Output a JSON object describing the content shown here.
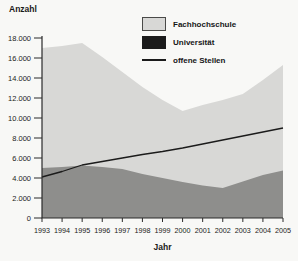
{
  "page": {
    "background": "#f8f8f6"
  },
  "chart_data": {
    "type": "area",
    "title": "",
    "xlabel": "Jahr",
    "ylabel": "Anzahl",
    "x": [
      1993,
      1994,
      1995,
      1996,
      1997,
      1998,
      1999,
      2000,
      2001,
      2002,
      2003,
      2004,
      2005
    ],
    "xtick_labels": [
      "1993",
      "1994",
      "1995",
      "1996",
      "1997",
      "1998",
      "1999",
      "2000",
      "2001",
      "2002",
      "2003",
      "2004",
      "2005"
    ],
    "ylim": [
      0,
      18000
    ],
    "ytick_step": 2000,
    "ytick_labels": [
      "0",
      "2.000",
      "4.000",
      "6.000",
      "8.000",
      "10.000",
      "12.000",
      "14.000",
      "16.000",
      "18.000"
    ],
    "grid": false,
    "legend_position": "top-right",
    "axis_color": "#2b2b2b",
    "text_color": "#1e1e1e",
    "series": [
      {
        "name": "Fachhochschule",
        "type": "area",
        "color": "#d8d8d6",
        "values": [
          17000,
          17200,
          17500,
          16100,
          14600,
          13100,
          11800,
          10700,
          11300,
          11800,
          12400,
          13800,
          15300
        ]
      },
      {
        "name": "Universität",
        "type": "area",
        "color": "#8e8e8c",
        "legend_swatch": "#1b1b1b",
        "values": [
          5000,
          5100,
          5250,
          5100,
          4900,
          4400,
          4000,
          3600,
          3250,
          3000,
          3650,
          4300,
          4750
        ]
      },
      {
        "name": "offene Stellen",
        "type": "line",
        "color": "#1b1b1b",
        "values": [
          4100,
          4650,
          5300,
          5650,
          6000,
          6350,
          6650,
          7000,
          7400,
          7800,
          8200,
          8600,
          9000
        ]
      }
    ]
  }
}
